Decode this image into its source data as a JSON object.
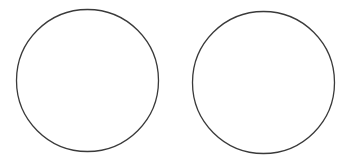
{
  "canvas": {
    "width": 346,
    "height": 165,
    "background": "#ffffff"
  },
  "shapes": [
    {
      "type": "circle",
      "name": "left-circle",
      "cx": 87.5,
      "cy": 80.5,
      "r": 71,
      "stroke": "#3a3a3a",
      "stroke_width": 1.3,
      "fill": "none"
    },
    {
      "type": "circle",
      "name": "right-circle",
      "cx": 263.5,
      "cy": 82.5,
      "r": 71,
      "stroke": "#3a3a3a",
      "stroke_width": 1.3,
      "fill": "none"
    }
  ]
}
